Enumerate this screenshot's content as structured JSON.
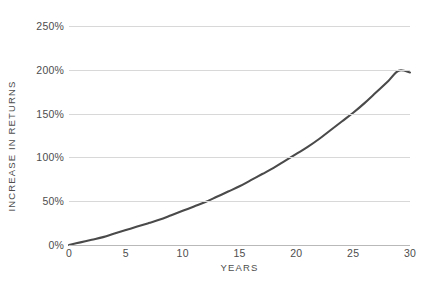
{
  "chart_data": {
    "type": "line",
    "title": "",
    "xlabel": "YEARS",
    "ylabel": "INCREASE IN RETURNS",
    "xlim": [
      0,
      30
    ],
    "ylim": [
      0,
      250
    ],
    "grid": true,
    "legend_position": "none",
    "x_tick_labels": [
      "0",
      "5",
      "10",
      "15",
      "20",
      "25",
      "30"
    ],
    "x_ticks": [
      0,
      5,
      10,
      15,
      20,
      25,
      30
    ],
    "y_tick_labels": [
      "0%",
      "50%",
      "100%",
      "150%",
      "200%",
      "250%"
    ],
    "y_ticks": [
      0,
      50,
      100,
      150,
      200,
      250
    ],
    "series": [
      {
        "name": "Increase in returns",
        "color": "#4a4a4a",
        "x": [
          0,
          1,
          2,
          3,
          4,
          5,
          6,
          7,
          8,
          9,
          10,
          11,
          12,
          13,
          14,
          15,
          16,
          17,
          18,
          19,
          20,
          21,
          22,
          23,
          24,
          25,
          26,
          27,
          28,
          29,
          30
        ],
        "values": [
          0,
          3,
          6,
          9,
          13,
          17,
          21,
          25,
          29,
          34,
          39,
          44,
          49,
          55,
          61,
          67,
          74,
          81,
          88,
          96,
          104,
          112,
          121,
          131,
          141,
          151,
          162,
          174,
          186,
          199,
          197
        ]
      }
    ],
    "annotations": []
  },
  "axes": {
    "y_title": "INCREASE IN RETURNS",
    "x_title": "YEARS"
  },
  "colors": {
    "curve": "#4a4a4a",
    "gridline": "#d8d8d8",
    "baseline": "#b9b9b9",
    "text": "#4d4d4d",
    "background": "#ffffff"
  }
}
